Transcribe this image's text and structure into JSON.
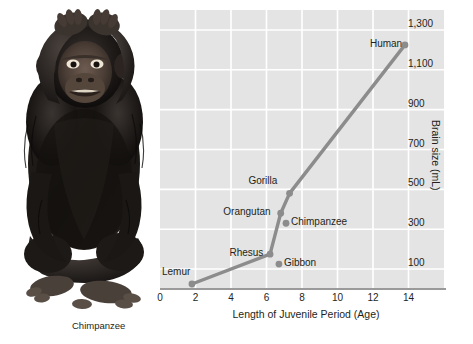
{
  "figure": {
    "photo_caption": "Chimpanzee",
    "photo_alt_name": "chimpanzee-photograph"
  },
  "chart_data": {
    "type": "line",
    "title": "",
    "xlabel": "Length of Juvenile Period (Age)",
    "ylabel": "Brain size (mL)",
    "xlim": [
      0,
      16
    ],
    "ylim": [
      0,
      1400
    ],
    "grid": true,
    "legend": "none",
    "xticks": [
      "0",
      "2",
      "4",
      "6",
      "8",
      "10",
      "12",
      "14"
    ],
    "xtick_values": [
      0,
      2,
      4,
      6,
      8,
      10,
      12,
      14
    ],
    "yticks": [
      "100",
      "300",
      "500",
      "700",
      "900",
      "1,100",
      "1,300"
    ],
    "ytick_values": [
      100,
      300,
      500,
      700,
      900,
      1100,
      1300
    ],
    "line_color": "#8c8c8c",
    "plot_background": "#e4e4e4",
    "gridline_color": "#ffffff",
    "points": [
      {
        "label": "Lemur",
        "x": 1.8,
        "y": 25,
        "label_side": "left-above"
      },
      {
        "label": "Rhesus",
        "x": 6.2,
        "y": 175,
        "label_side": "left"
      },
      {
        "label": "Gibbon",
        "x": 6.7,
        "y": 125,
        "label_side": "right"
      },
      {
        "label": "Orangutan",
        "x": 6.8,
        "y": 380,
        "label_side": "left"
      },
      {
        "label": "Chimpanzee",
        "x": 7.1,
        "y": 330,
        "label_side": "right"
      },
      {
        "label": "Gorilla",
        "x": 7.3,
        "y": 480,
        "label_side": "left-above"
      },
      {
        "label": "Human",
        "x": 13.8,
        "y": 1225,
        "label_side": "left"
      }
    ],
    "series": [
      {
        "name": "Primate brain size vs juvenile period",
        "x": [
          1.8,
          6.2,
          6.8,
          7.3,
          13.8
        ],
        "values": [
          25,
          175,
          380,
          480,
          1225
        ]
      }
    ]
  }
}
